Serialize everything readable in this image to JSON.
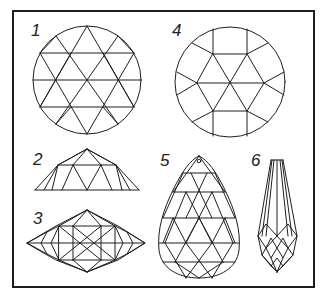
{
  "figure": {
    "background": "#ffffff",
    "line_color": "#1e1e1e",
    "panels": [
      {
        "id": "1",
        "label": "1",
        "shape": "round, triangular facet grid (top view)"
      },
      {
        "id": "2",
        "label": "2",
        "shape": "half-dome / rose cut (side view)"
      },
      {
        "id": "3",
        "label": "3",
        "shape": "double rose cut (side view)"
      },
      {
        "id": "4",
        "label": "4",
        "shape": "round with hexagon star centre (top view)"
      },
      {
        "id": "5",
        "label": "5",
        "shape": "pear-shaped briolette pendant with drill hole"
      },
      {
        "id": "6",
        "label": "6",
        "shape": "elongated drop briolette"
      }
    ]
  }
}
